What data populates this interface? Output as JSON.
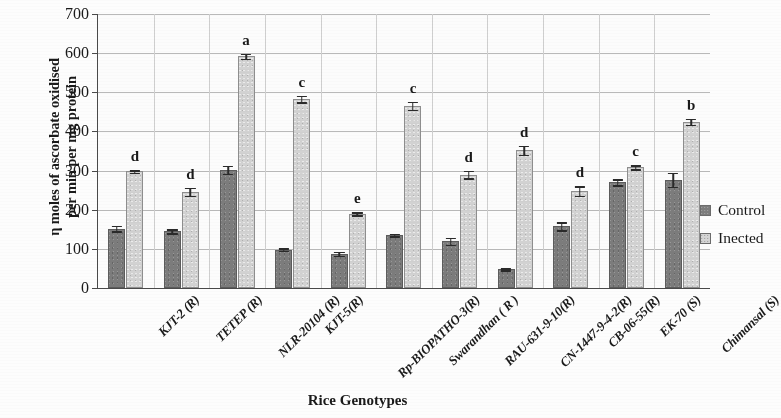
{
  "chart_data": {
    "type": "bar",
    "title": "",
    "xlabel": "Rice Genotypes",
    "ylabel_line1": "η moles of ascorbate oxidised",
    "ylabel_line2": "per min per mg protein",
    "ylim": [
      0,
      700
    ],
    "ytick_step": 100,
    "yticks": [
      "700",
      "600",
      "500",
      "400",
      "300",
      "200",
      "100",
      "0"
    ],
    "grid": true,
    "legend_position": "right",
    "categories": [
      "KJT-2 (R)",
      "TETEP  (R)",
      "NLR-20104 (R)",
      "KJT-5(R)",
      "Rp-BIOPATHO-3(R)",
      "Swarandhan ( R )",
      "RAU-631-9-10(R)",
      "CN-1447-9-4-2(R)",
      "CB-06-55(R)",
      "EK-70 (S)",
      "Chimansal (S)"
    ],
    "series": [
      {
        "name": "Control",
        "color": "#7c7c7c",
        "values": [
          152,
          145,
          302,
          98,
          88,
          135,
          120,
          48,
          158,
          270,
          277
        ],
        "errors": [
          7,
          5,
          10,
          3,
          5,
          3,
          9,
          3,
          10,
          8,
          18
        ]
      },
      {
        "name": "Inected",
        "color": "#d2d2d2",
        "values": [
          298,
          246,
          592,
          483,
          190,
          466,
          290,
          352,
          248,
          308,
          425
        ],
        "errors": [
          3,
          10,
          6,
          8,
          4,
          10,
          10,
          12,
          12,
          5,
          8
        ]
      }
    ],
    "significance_letters": [
      "d",
      "d",
      "a",
      "c",
      "e",
      "c",
      "d",
      "d",
      "d",
      "c",
      "b"
    ]
  },
  "legend": {
    "items": [
      {
        "label": "Control",
        "swatch": "control"
      },
      {
        "label": "Inected",
        "swatch": "infected"
      }
    ]
  }
}
